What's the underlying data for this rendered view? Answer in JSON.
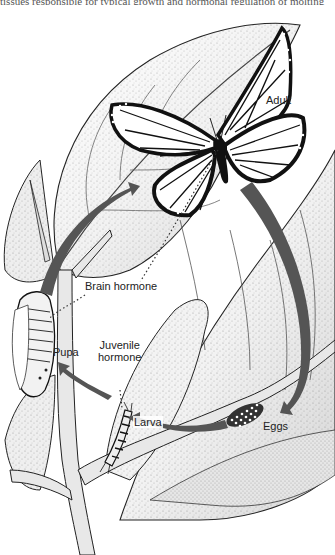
{
  "figure": {
    "top_cropped_text": "tissues responsible for typical growth and hormonal regulation of molting",
    "labels": {
      "adult": "Adult",
      "brain_hormone": "Brain hormone",
      "pupa": "Pupa",
      "juvenile_hormone_line1": "Juvenile",
      "juvenile_hormone_line2": "hormone",
      "larva": "Larva",
      "eggs": "Eggs"
    },
    "colors": {
      "arrow": "#555555",
      "outline": "#1a1a1a",
      "leaf_shade": "#9a9a9a",
      "background": "#ffffff",
      "wing_black": "#111111",
      "wing_fill": "#ffffff"
    }
  }
}
